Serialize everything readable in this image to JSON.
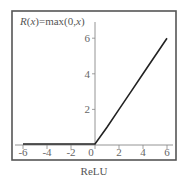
{
  "chart_data": {
    "type": "line",
    "title": "R(x)=max(0,x)",
    "title_parts": [
      {
        "text": "R",
        "italic": true
      },
      {
        "text": "(",
        "italic": false
      },
      {
        "text": "x",
        "italic": true
      },
      {
        "text": ")=max(0,",
        "italic": false
      },
      {
        "text": "x",
        "italic": true
      },
      {
        "text": ")",
        "italic": false
      }
    ],
    "caption": "ReLU",
    "xlabel": "",
    "ylabel": "",
    "xlim": [
      -6.6,
      6.5
    ],
    "ylim": [
      0,
      7
    ],
    "grid": false,
    "legend": null,
    "x_ticks": [
      -6,
      -4,
      -2,
      0,
      2,
      4,
      6
    ],
    "x_tick_labels": [
      "-6",
      "-4",
      "-2",
      "0",
      "2",
      "4",
      "6"
    ],
    "y_ticks": [
      2,
      4,
      6
    ],
    "y_tick_labels": [
      "2",
      "4",
      "6"
    ],
    "series": [
      {
        "name": "ReLU",
        "x": [
          -6,
          -5,
          -4,
          -3,
          -2,
          -1,
          0,
          1,
          2,
          3,
          4,
          5,
          6
        ],
        "y": [
          0,
          0,
          0,
          0,
          0,
          0,
          0,
          1,
          2,
          3,
          4,
          5,
          6
        ],
        "color": "#222222"
      }
    ],
    "colors": {
      "frame": "#555555",
      "axis": "#888888",
      "line": "#222222",
      "text": "#666666"
    }
  }
}
